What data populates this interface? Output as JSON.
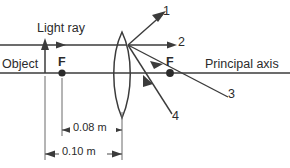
{
  "diagram": {
    "labels": {
      "light_ray": "Light ray",
      "object": "Object",
      "focal_left": "F",
      "focal_right": "F",
      "principal_axis": "Principal axis"
    },
    "rays": [
      {
        "id": "ray-1",
        "label": "1"
      },
      {
        "id": "ray-2",
        "label": "2"
      },
      {
        "id": "ray-3",
        "label": "3"
      },
      {
        "id": "ray-4",
        "label": "4"
      }
    ],
    "dimensions": [
      {
        "id": "focal-length",
        "label": "0.08 m"
      },
      {
        "id": "object-distance",
        "label": "0.10 m"
      }
    ],
    "colors": {
      "line": "#3b3b3b",
      "point": "#2b2b2b",
      "text": "#2b2b2b",
      "background": "#ffffff"
    }
  }
}
